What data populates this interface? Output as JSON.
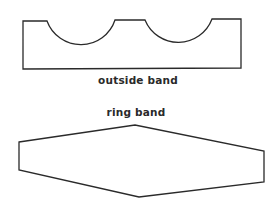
{
  "diagram": {
    "shapes": [
      {
        "id": "outside-band",
        "label": "outside band",
        "description": "Rectangular strip with two semicircular cut-outs along the top edge"
      },
      {
        "id": "ring-band",
        "label": "ring band",
        "description": "Elongated hexagon tapering to points at top and bottom centre"
      }
    ],
    "colors": {
      "stroke": "#2a2a2a",
      "background": "#ffffff"
    }
  }
}
